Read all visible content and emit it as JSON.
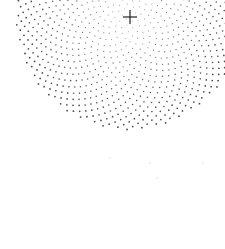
{
  "canvas": {
    "width": 225,
    "height": 249,
    "background": "#ffffff"
  },
  "pattern": {
    "type": "phyllotaxis-dot-spiral",
    "center": {
      "x": 129,
      "y": 17
    },
    "dot_count": 1100,
    "spacing": 3.4,
    "max_radius": 114,
    "dot_color": "#333333",
    "inner_dot_radius": 0.45,
    "outer_dot_radius": 0.9
  },
  "crosshair": {
    "icon": "crosshair-icon",
    "x": 130,
    "y": 17,
    "arm": 7,
    "color": "#222222",
    "stroke": 1.2
  },
  "faint_dots": [
    {
      "x": 110,
      "y": 158
    },
    {
      "x": 150,
      "y": 163
    },
    {
      "x": 203,
      "y": 163
    },
    {
      "x": 157,
      "y": 178
    }
  ]
}
